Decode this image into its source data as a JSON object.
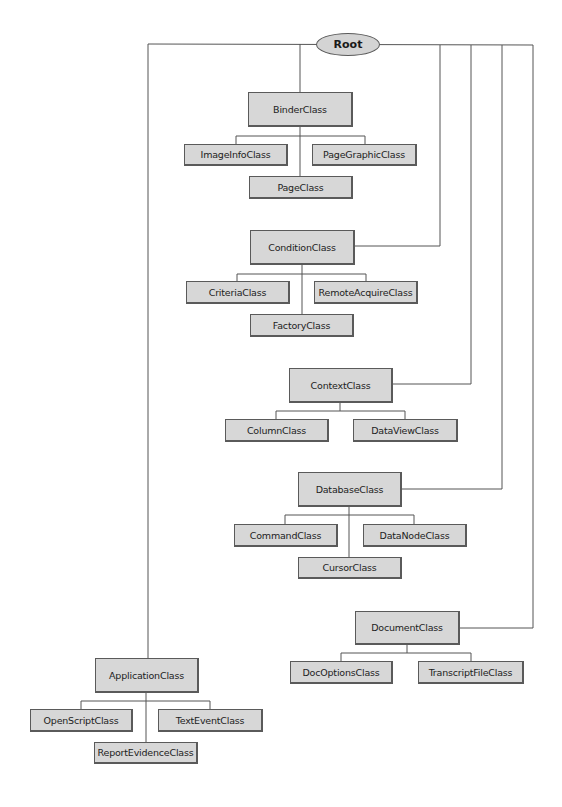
{
  "diagram": {
    "type": "class-hierarchy-tree",
    "root": {
      "label": "Root"
    },
    "line_color": "#555555",
    "box_fill": "#d7d7d7",
    "nodes": {
      "binder": "BinderClass",
      "imageinfo": "ImageInfoClass",
      "pagegraphic": "PageGraphicClass",
      "page": "PageClass",
      "condition": "ConditionClass",
      "criteria": "CriteriaClass",
      "remoteacquire": "RemoteAcquireClass",
      "factory": "FactoryClass",
      "context": "ContextClass",
      "column": "ColumnClass",
      "dataview": "DataViewClass",
      "database": "DatabaseClass",
      "command": "CommandClass",
      "datanode": "DataNodeClass",
      "cursor": "CursorClass",
      "document": "DocumentClass",
      "docoptions": "DocOptionsClass",
      "transcriptfile": "TranscriptFileClass",
      "application": "ApplicationClass",
      "openscript": "OpenScriptClass",
      "textevent": "TextEventClass",
      "reportevidence": "ReportEvidenceClass"
    },
    "hierarchy": [
      {
        "parent": "BinderClass",
        "children": [
          "ImageInfoClass",
          "PageClass",
          "PageGraphicClass"
        ]
      },
      {
        "parent": "ConditionClass",
        "children": [
          "CriteriaClass",
          "FactoryClass",
          "RemoteAcquireClass"
        ]
      },
      {
        "parent": "ContextClass",
        "children": [
          "ColumnClass",
          "DataViewClass"
        ]
      },
      {
        "parent": "DatabaseClass",
        "children": [
          "CommandClass",
          "CursorClass",
          "DataNodeClass"
        ]
      },
      {
        "parent": "DocumentClass",
        "children": [
          "DocOptionsClass",
          "TranscriptFileClass"
        ]
      },
      {
        "parent": "ApplicationClass",
        "children": [
          "OpenScriptClass",
          "ReportEvidenceClass",
          "TextEventClass"
        ]
      }
    ]
  }
}
